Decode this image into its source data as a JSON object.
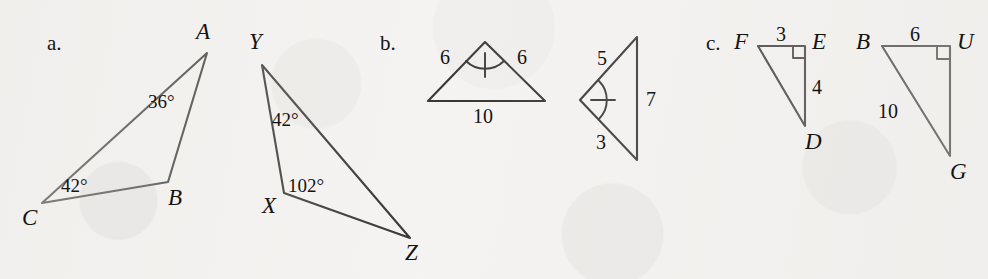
{
  "figure": {
    "background_color": "#f4f3f1",
    "ink_color": "#161412",
    "width": 988,
    "height": 279
  },
  "parts": {
    "a": {
      "letter": "a.",
      "letter_pos": {
        "x": 47,
        "y": 33
      },
      "triangles": [
        {
          "name": "triangle-abc",
          "vertices": [
            {
              "label": "A",
              "x": 207,
              "y": 53,
              "label_x": 196,
              "label_y": 20
            },
            {
              "label": "B",
              "x": 168,
              "y": 182,
              "label_x": 168,
              "label_y": 186
            },
            {
              "label": "C",
              "x": 42,
              "y": 203,
              "label_x": 22,
              "label_y": 206
            }
          ],
          "angle_marks": [
            {
              "at": "A",
              "value": "36°",
              "x": 148,
              "y": 92
            },
            {
              "at": "C",
              "value": "42°",
              "x": 61,
              "y": 176
            }
          ]
        },
        {
          "name": "triangle-xyz",
          "vertices": [
            {
              "label": "Y",
              "x": 262,
              "y": 65,
              "label_x": 249,
              "label_y": 30
            },
            {
              "label": "X",
              "x": 284,
              "y": 193,
              "label_x": 262,
              "label_y": 194
            },
            {
              "label": "Z",
              "x": 410,
              "y": 238,
              "label_x": 405,
              "label_y": 241
            }
          ],
          "angle_marks": [
            {
              "at": "Y",
              "value": "42°",
              "x": 272,
              "y": 110
            },
            {
              "at": "X",
              "value": "102°",
              "x": 288,
              "y": 176
            }
          ]
        }
      ]
    },
    "b": {
      "letter": "b.",
      "letter_pos": {
        "x": 380,
        "y": 33
      },
      "triangles": [
        {
          "name": "triangle-isosceles-6-6-10",
          "vertices": [
            {
              "x": 485,
              "y": 42
            },
            {
              "x": 428,
              "y": 101
            },
            {
              "x": 545,
              "y": 101
            }
          ],
          "side_labels": [
            {
              "value": "6",
              "x": 440,
              "y": 47
            },
            {
              "value": "6",
              "x": 517,
              "y": 47
            },
            {
              "value": "10",
              "x": 473,
              "y": 106
            }
          ],
          "angle_mark": {
            "type": "arc-with-tick",
            "vertex_x": 485,
            "vertex_y": 42
          }
        },
        {
          "name": "triangle-5-3-7",
          "vertices": [
            {
              "x": 580,
              "y": 100
            },
            {
              "x": 637,
              "y": 37
            },
            {
              "x": 637,
              "y": 160
            }
          ],
          "side_labels": [
            {
              "value": "5",
              "x": 597,
              "y": 48
            },
            {
              "value": "3",
              "x": 596,
              "y": 132
            },
            {
              "value": "7",
              "x": 646,
              "y": 89
            }
          ],
          "angle_mark": {
            "type": "arc-with-tick",
            "vertex_x": 580,
            "vertex_y": 100
          }
        }
      ]
    },
    "c": {
      "letter": "c.",
      "letter_pos": {
        "x": 706,
        "y": 33
      },
      "triangles": [
        {
          "name": "triangle-fed",
          "vertices": [
            {
              "label": "F",
              "x": 758,
              "y": 46,
              "label_x": 734,
              "label_y": 30
            },
            {
              "label": "E",
              "x": 805,
              "y": 46,
              "label_x": 812,
              "label_y": 30
            },
            {
              "label": "D",
              "x": 805,
              "y": 126,
              "label_x": 805,
              "label_y": 130
            }
          ],
          "side_labels": [
            {
              "value": "3",
              "x": 776,
              "y": 24
            },
            {
              "value": "4",
              "x": 812,
              "y": 77
            }
          ],
          "right_angle": {
            "at": "E",
            "x": 805,
            "y": 46,
            "dx": -1,
            "dy": 1
          }
        },
        {
          "name": "triangle-bug",
          "vertices": [
            {
              "label": "B",
              "x": 882,
              "y": 46,
              "label_x": 856,
              "label_y": 30
            },
            {
              "label": "U",
              "x": 950,
              "y": 46,
              "label_x": 957,
              "label_y": 30
            },
            {
              "label": "G",
              "x": 950,
              "y": 156,
              "label_x": 950,
              "label_y": 160
            }
          ],
          "side_labels": [
            {
              "value": "6",
              "x": 910,
              "y": 24
            },
            {
              "value": "10",
              "x": 878,
              "y": 101
            }
          ],
          "right_angle": {
            "at": "U",
            "x": 950,
            "y": 46,
            "dx": -1,
            "dy": 1
          }
        }
      ]
    }
  }
}
